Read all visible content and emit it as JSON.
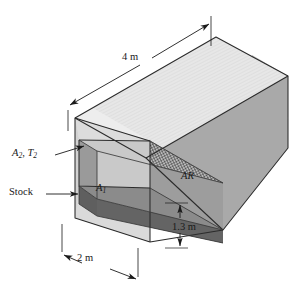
{
  "figure": {
    "labels": {
      "length": "4 m",
      "width": "2 m",
      "height": "1.3 m",
      "heater_area": "A",
      "heater_area_sub": "2",
      "heater_temp": "T",
      "heater_temp_sub": "2",
      "heater_separator": ", ",
      "stock": "Stock",
      "stock_area": "A",
      "stock_area_sub": "1",
      "refractory": "AR"
    },
    "colors": {
      "outline": "#1a1a1a",
      "top_face": "#e3e3e3",
      "front_face": "#a8a8a8",
      "right_face": "#b4b4b4",
      "cavity_ceiling": "#d4d4d4",
      "cavity_back": "#8f8f8f",
      "stock_top": "#6e6e6e",
      "stock_front": "#5a5a5a",
      "wall_edge": "#cfcfcf",
      "hatch": "#3a3a3a",
      "text": "#1a1a1a",
      "background": "#ffffff"
    },
    "dimensions": {
      "length_m": 4,
      "width_m": 2,
      "height_m": 1.3
    }
  }
}
